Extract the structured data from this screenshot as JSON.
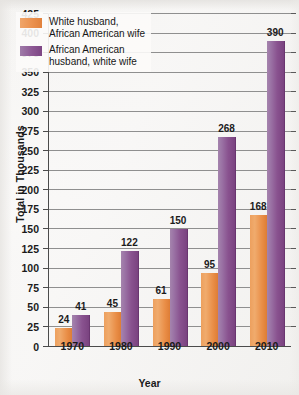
{
  "chart_data": {
    "type": "bar",
    "title": "",
    "xlabel": "Year",
    "ylabel": "Total in Thousands",
    "categories": [
      "1970",
      "1980",
      "1990",
      "2000",
      "2010"
    ],
    "series": [
      {
        "name": "White husband,\nAfrican American wife",
        "color": "#eb914e",
        "values": [
          24,
          45,
          61,
          95,
          168
        ]
      },
      {
        "name": "African American\nhusband, white wife",
        "color": "#8d5894",
        "values": [
          41,
          122,
          150,
          268,
          390
        ]
      }
    ],
    "ylim": [
      0,
      425
    ],
    "ytick_step": 25,
    "yticks": [
      0,
      25,
      50,
      75,
      100,
      125,
      150,
      175,
      200,
      225,
      250,
      275,
      300,
      325,
      350,
      375,
      400,
      425
    ],
    "grid": true,
    "legend_position": "top-left"
  },
  "axes": {
    "y_title": "Total in Thousands",
    "x_title": "Year"
  },
  "legend": {
    "items": [
      {
        "label": "White husband,\nAfrican American wife",
        "color": "#eb914e"
      },
      {
        "label": "African American\nhusband, white wife",
        "color": "#8d5894"
      }
    ]
  }
}
